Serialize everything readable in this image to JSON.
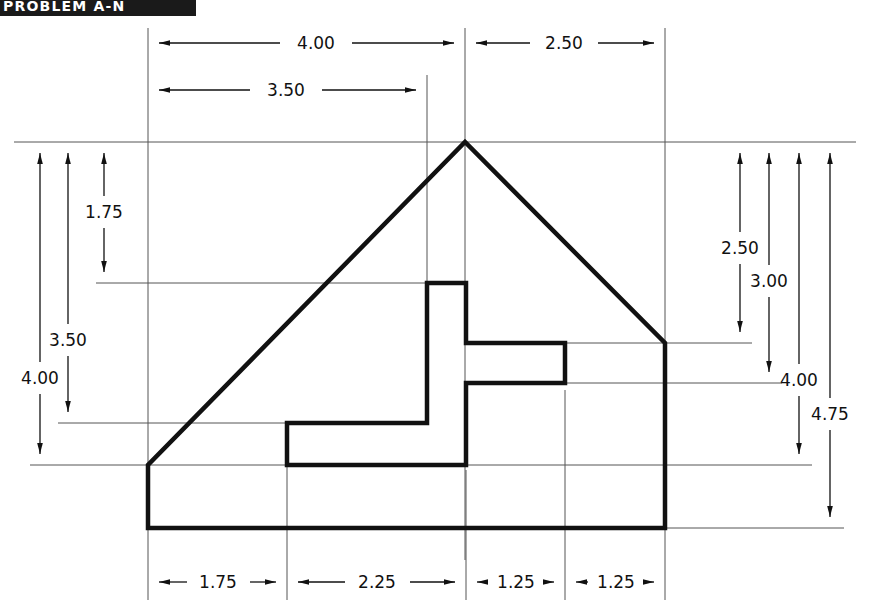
{
  "sheet": {
    "width": 870,
    "height": 616,
    "background": "#ffffff",
    "line_color": "#111111",
    "thin_line_color": "#555555"
  },
  "title_bar": {
    "label": "PROBLEM A-N",
    "background": "#1a1a1a",
    "text_color": "#ffffff"
  },
  "drawing": {
    "type": "engineering-dimensioned-outline",
    "units": "inches",
    "description": "Front view of a gable/pentagon shaped part with an internal T-shaped slot, fully dimensioned",
    "dimensions": {
      "top": [
        {
          "name": "top-dim-4-00",
          "label": "4.00",
          "from_x": 148,
          "to_x": 465,
          "y": 43,
          "text_x": 316,
          "text_y": 41
        },
        {
          "name": "top-dim-2-50",
          "label": "2.50",
          "from_x": 465,
          "to_x": 665,
          "y": 43,
          "text_x": 564,
          "text_y": 41
        },
        {
          "name": "top-dim-3-50",
          "label": "3.50",
          "from_x": 148,
          "to_x": 427,
          "y": 90,
          "text_x": 285,
          "text_y": 88
        }
      ],
      "left": [
        {
          "name": "left-dim-1-75",
          "label": "1.75",
          "from_y": 142,
          "to_y": 283,
          "x": 104,
          "text_x": 100,
          "text_y": 212
        },
        {
          "name": "left-dim-3-50",
          "label": "3.50",
          "from_y": 142,
          "to_y": 423,
          "x": 68,
          "text_x": 64,
          "text_y": 340
        },
        {
          "name": "left-dim-4-00",
          "label": "4.00",
          "from_y": 142,
          "to_y": 465,
          "x": 40,
          "text_x": 36,
          "text_y": 378
        }
      ],
      "right": [
        {
          "name": "right-dim-2-50",
          "label": "2.50",
          "from_y": 142,
          "to_y": 343,
          "x": 740,
          "text_x": 736,
          "text_y": 248
        },
        {
          "name": "right-dim-3-00",
          "label": "3.00",
          "from_y": 142,
          "to_y": 383,
          "x": 769,
          "text_x": 765,
          "text_y": 281
        },
        {
          "name": "right-dim-4-00",
          "label": "4.00",
          "from_y": 142,
          "to_y": 465,
          "x": 799,
          "text_x": 795,
          "text_y": 380
        },
        {
          "name": "right-dim-4-75",
          "label": "4.75",
          "from_y": 142,
          "to_y": 528,
          "x": 830,
          "text_x": 826,
          "text_y": 414
        }
      ],
      "bottom": [
        {
          "name": "bottom-dim-1-75",
          "label": "1.75",
          "from_x": 148,
          "to_x": 287,
          "y": 582,
          "text_x": 218,
          "text_y": 580
        },
        {
          "name": "bottom-dim-2-25",
          "label": "2.25",
          "from_x": 287,
          "to_x": 466,
          "y": 582,
          "text_x": 377,
          "text_y": 580
        },
        {
          "name": "bottom-dim-1-25",
          "label": "1.25",
          "from_x": 466,
          "to_x": 565,
          "y": 582,
          "text_x": 516,
          "text_y": 580
        },
        {
          "name": "bottom-dim-1-25-b",
          "label": "1.25",
          "from_x": 565,
          "to_x": 665,
          "y": 582,
          "text_x": 615,
          "text_y": 580
        }
      ]
    },
    "outer_profile": {
      "name": "part-outer-profile",
      "points": "148,465 148,528 665,528 665,343 465,142 148,465",
      "vertices": [
        {
          "x": 148,
          "y": 465
        },
        {
          "x": 148,
          "y": 528
        },
        {
          "x": 665,
          "y": 528
        },
        {
          "x": 665,
          "y": 343
        },
        {
          "x": 465,
          "y": 142
        }
      ]
    },
    "inner_profile": {
      "name": "part-inner-slot",
      "points": "427,283 466,283 466,343 565,343 565,383 466,383 466,465 287,465 287,423 427,423 427,283"
    },
    "extension_lines": [
      {
        "name": "ext-line-apex-vertical",
        "x1": 465,
        "y1": 28,
        "x2": 465,
        "y2": 560
      },
      {
        "name": "ext-line-left-vertical",
        "x1": 148,
        "y1": 28,
        "x2": 148,
        "y2": 600
      },
      {
        "name": "ext-line-right-vertical",
        "x1": 665,
        "y1": 28,
        "x2": 665,
        "y2": 600
      },
      {
        "name": "ext-line-slot-left-vertical",
        "x1": 427,
        "y1": 75,
        "x2": 427,
        "y2": 300
      },
      {
        "name": "ext-line-slot-x287",
        "x1": 287,
        "y1": 440,
        "x2": 287,
        "y2": 600
      },
      {
        "name": "ext-line-slot-x466",
        "x1": 466,
        "y1": 470,
        "x2": 466,
        "y2": 600
      },
      {
        "name": "ext-line-slot-x565",
        "x1": 565,
        "y1": 390,
        "x2": 565,
        "y2": 600
      },
      {
        "name": "ext-line-top-horizontal",
        "x1": 14,
        "y1": 142,
        "x2": 856,
        "y2": 142
      },
      {
        "name": "ext-line-y283",
        "x1": 96,
        "y1": 283,
        "x2": 466,
        "y2": 283
      },
      {
        "name": "ext-line-y423",
        "x1": 58,
        "y1": 423,
        "x2": 427,
        "y2": 423
      },
      {
        "name": "ext-line-y465-left",
        "x1": 30,
        "y1": 465,
        "x2": 290,
        "y2": 465
      },
      {
        "name": "ext-line-y343-right",
        "x1": 565,
        "y1": 343,
        "x2": 752,
        "y2": 343
      },
      {
        "name": "ext-line-y383-right",
        "x1": 565,
        "y1": 383,
        "x2": 782,
        "y2": 383
      },
      {
        "name": "ext-line-y465-right",
        "x1": 466,
        "y1": 465,
        "x2": 812,
        "y2": 465
      },
      {
        "name": "ext-line-y528-right",
        "x1": 665,
        "y1": 528,
        "x2": 844,
        "y2": 528
      }
    ]
  }
}
